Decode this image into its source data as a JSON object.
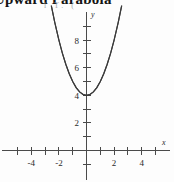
{
  "heading": {
    "text": "Upward Parabola",
    "subtext": "l  T.  ("
  },
  "chart_data": {
    "type": "line",
    "title": "Upward Parabola",
    "xlabel": "x",
    "ylabel": "y",
    "grid": false,
    "legend": null,
    "equation": "y = x^2 + 4",
    "vertex": {
      "x": 0,
      "y": 4
    },
    "xlim": [
      -6.2,
      6.2
    ],
    "ylim": [
      -2.1,
      10.7
    ],
    "x_ticks": [
      -5,
      -4,
      -3,
      -2,
      -1,
      1,
      2,
      3,
      4,
      5
    ],
    "x_tick_labels": [
      "-4",
      "-2",
      "2",
      "4"
    ],
    "x_labeled_values": [
      -4,
      -2,
      2,
      4
    ],
    "y_ticks": [
      -1,
      1,
      2,
      3,
      4,
      5,
      6,
      7,
      8,
      9,
      10
    ],
    "y_tick_labels": [
      "2",
      "4",
      "6",
      "8"
    ],
    "y_labeled_values": [
      2,
      4,
      6,
      8
    ],
    "series": [
      {
        "name": "y = x^2 + 4",
        "x": [
          -2.55,
          -2.3,
          -2.0,
          -1.75,
          -1.5,
          -1.25,
          -1.0,
          -0.75,
          -0.5,
          -0.25,
          0,
          0.25,
          0.5,
          0.75,
          1.0,
          1.25,
          1.5,
          1.75,
          2.0,
          2.3,
          2.55
        ],
        "y": [
          10.5,
          9.29,
          8.0,
          7.06,
          6.25,
          5.56,
          5.0,
          4.56,
          4.25,
          4.06,
          4.0,
          4.06,
          4.25,
          4.56,
          5.0,
          5.56,
          6.25,
          7.06,
          8.0,
          9.29,
          10.5
        ]
      }
    ]
  },
  "axis_labels": {
    "x": "x",
    "y": "y"
  }
}
